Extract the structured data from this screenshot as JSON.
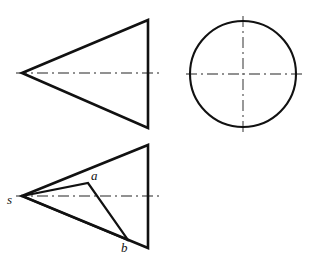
{
  "figure": {
    "background_color": "#ffffff",
    "outline_color": "#111111",
    "centerline_color": "#6d6d6d",
    "width": 322,
    "height": 259
  },
  "views": {
    "front_view": {
      "name": "front-view-cone-triangle",
      "shape": "triangle",
      "apex": [
        22,
        73
      ],
      "top_right": [
        148,
        20
      ],
      "bottom_right": [
        148,
        128
      ],
      "stroke_width": 2.6,
      "axis": {
        "name": "front-view-axis",
        "x1": 16,
        "y1": 73,
        "x2": 159,
        "y2": 73,
        "style": "dash-dot"
      }
    },
    "top_view": {
      "name": "top-view-cone-circle",
      "shape": "circle",
      "center": [
        243,
        74
      ],
      "radius": 53,
      "stroke_width": 2.0,
      "axis_horizontal": {
        "name": "top-view-axis-horizontal",
        "x1": 186,
        "y1": 74,
        "x2": 302,
        "y2": 74,
        "style": "dash-dot"
      },
      "axis_vertical": {
        "name": "top-view-axis-vertical",
        "x1": 243,
        "y1": 16,
        "x2": 243,
        "y2": 132,
        "style": "dash-dot"
      }
    },
    "auxiliary_view": {
      "name": "auxiliary-view-cone-triangle",
      "shape": "triangle",
      "apex": [
        22,
        196
      ],
      "top_right": [
        148,
        145
      ],
      "bottom_right": [
        148,
        248
      ],
      "stroke_width": 2.6,
      "axis": {
        "name": "auxiliary-view-axis",
        "x1": 16,
        "y1": 196,
        "x2": 159,
        "y2": 196,
        "style": "dash-dot"
      },
      "construction_lines": [
        {
          "name": "line-s-to-a",
          "from": [
            22,
            196
          ],
          "to": [
            88,
            183
          ]
        },
        {
          "name": "line-a-to-b",
          "from": [
            88,
            183
          ],
          "to": [
            128,
            240
          ]
        },
        {
          "name": "line-s-to-b",
          "from": [
            22,
            196
          ],
          "to": [
            128,
            240
          ]
        }
      ]
    }
  },
  "labels": {
    "s": "s",
    "a": "a",
    "b": "b"
  }
}
